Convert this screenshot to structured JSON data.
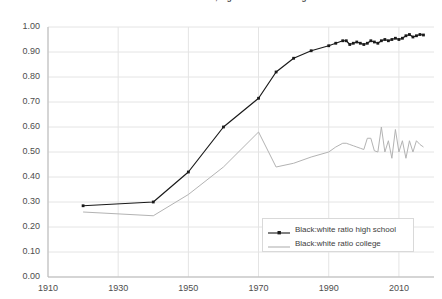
{
  "chart_data": {
    "type": "line",
    "title": "Black:white ratios in educational attainment, high school and college",
    "xlabel": "",
    "ylabel": "",
    "xlim": [
      1910,
      2020
    ],
    "ylim": [
      0.0,
      1.0
    ],
    "grid": true,
    "legend_position": "bottom-right",
    "xticks": [
      "1910",
      "1930",
      "1950",
      "1970",
      "1990",
      "2010"
    ],
    "xtick_values": [
      1910,
      1930,
      1950,
      1970,
      1990,
      2010
    ],
    "yticks": [
      "0.00",
      "0.10",
      "0.20",
      "0.30",
      "0.40",
      "0.50",
      "0.60",
      "0.70",
      "0.80",
      "0.90",
      "1.00"
    ],
    "ytick_values": [
      0.0,
      0.1,
      0.2,
      0.3,
      0.4,
      0.5,
      0.6,
      0.7,
      0.8,
      0.9,
      1.0
    ],
    "series": [
      {
        "name": "Black:white ratio high school",
        "color": "#1a1a1a",
        "marker": "square",
        "x": [
          1920,
          1940,
          1950,
          1960,
          1970,
          1975,
          1980,
          1985,
          1990,
          1992,
          1994,
          1995,
          1996,
          1997,
          1998,
          1999,
          2000,
          2001,
          2002,
          2003,
          2004,
          2005,
          2006,
          2007,
          2008,
          2009,
          2010,
          2011,
          2012,
          2013,
          2014,
          2015,
          2016,
          2017
        ],
        "values": [
          0.285,
          0.3,
          0.42,
          0.6,
          0.715,
          0.82,
          0.875,
          0.905,
          0.925,
          0.935,
          0.945,
          0.945,
          0.93,
          0.935,
          0.94,
          0.935,
          0.93,
          0.935,
          0.945,
          0.94,
          0.935,
          0.945,
          0.95,
          0.945,
          0.95,
          0.955,
          0.95,
          0.955,
          0.965,
          0.97,
          0.96,
          0.965,
          0.97,
          0.968
        ]
      },
      {
        "name": "Black:white ratio college",
        "color": "#b3b3b3",
        "marker": "none",
        "x": [
          1920,
          1940,
          1950,
          1960,
          1970,
          1975,
          1980,
          1985,
          1990,
          1992,
          1994,
          1995,
          1996,
          1997,
          1998,
          1999,
          2000,
          2001,
          2002,
          2003,
          2004,
          2005,
          2006,
          2007,
          2008,
          2009,
          2010,
          2011,
          2012,
          2013,
          2014,
          2015,
          2016,
          2017
        ],
        "values": [
          0.26,
          0.245,
          0.33,
          0.44,
          0.58,
          0.44,
          0.455,
          0.48,
          0.5,
          0.52,
          0.535,
          0.535,
          0.53,
          0.525,
          0.52,
          0.515,
          0.51,
          0.555,
          0.555,
          0.505,
          0.5,
          0.6,
          0.5,
          0.545,
          0.475,
          0.59,
          0.5,
          0.545,
          0.475,
          0.545,
          0.5,
          0.545,
          0.53,
          0.52
        ]
      }
    ]
  }
}
